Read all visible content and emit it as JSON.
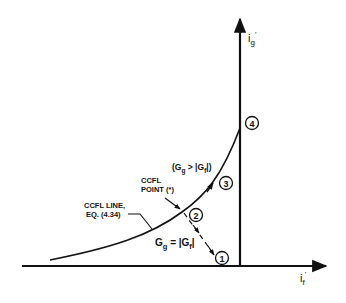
{
  "diagram": {
    "axes": {
      "vertical": {
        "label_main": "i",
        "label_sub": "g",
        "label_prime": "'"
      },
      "horizontal": {
        "label_main": "i",
        "label_sub": "f",
        "label_prime": "'"
      }
    },
    "points": [
      {
        "id": "1",
        "label": "1"
      },
      {
        "id": "2",
        "label": "2"
      },
      {
        "id": "3",
        "label": "3"
      },
      {
        "id": "4",
        "label": "4"
      }
    ],
    "annotations": {
      "condition_greater": {
        "open": "(G",
        "sub1": "g",
        "mid": " > |G",
        "sub2": "f",
        "close": "|)"
      },
      "ccfl_point": {
        "line1": "CCFL",
        "line2": "POINT (*)"
      },
      "ccfl_line": {
        "line1": "CCFL LINE,",
        "line2": "EQ. (4.34)"
      },
      "condition_equal": {
        "pre": "G",
        "sub1": "g",
        "mid": " = |G",
        "sub2": "f",
        "close": "|"
      }
    },
    "colors": {
      "ink": "#111111",
      "background": "#ffffff"
    }
  }
}
